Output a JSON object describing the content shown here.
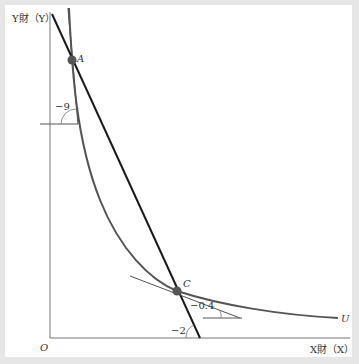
{
  "diagram": {
    "axes": {
      "y_label": "Y財（Y）",
      "x_label": "X財（X）",
      "origin_label": "O"
    },
    "points": [
      {
        "label": "A",
        "x": 72,
        "y": 60
      },
      {
        "label": "C",
        "x": 177,
        "y": 291
      }
    ],
    "curve_label": "U",
    "slopes": {
      "tangent_at_A": "−9",
      "tangent_at_C": "−0.4",
      "budget_line": "−2"
    },
    "colors": {
      "curve": "#555555",
      "budget_line": "#1a1a1a",
      "point": "#555555",
      "frame": "#e6e6e6"
    }
  }
}
